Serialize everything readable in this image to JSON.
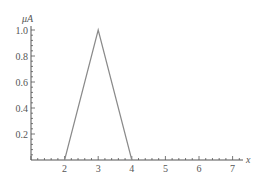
{
  "chart_data": {
    "type": "line",
    "title": "",
    "xlabel": "x",
    "ylabel": "μA",
    "xlim": [
      1,
      7.3
    ],
    "ylim": [
      0,
      1.05
    ],
    "x_ticks": [
      "2",
      "3",
      "4",
      "5",
      "6",
      "7"
    ],
    "y_ticks": [
      "0.2",
      "0.4",
      "0.6",
      "0.8",
      "1.0"
    ],
    "grid": false,
    "series": [
      {
        "name": "triangular membership function",
        "x": [
          2,
          3,
          4
        ],
        "y": [
          0,
          1.0,
          0
        ]
      }
    ],
    "colors": {
      "line": "#8a8a8a",
      "axis": "#555555"
    }
  }
}
